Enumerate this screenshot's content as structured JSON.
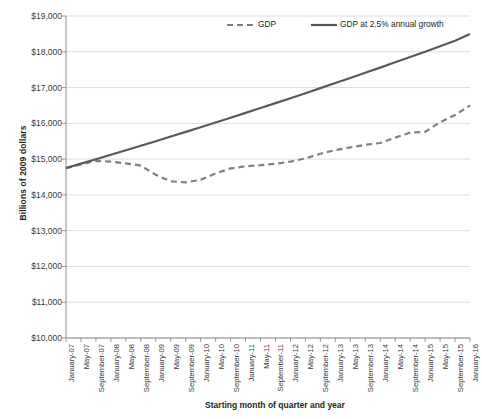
{
  "chart_data": {
    "type": "line",
    "title": "",
    "xlabel": "Starting month of quarter and year",
    "ylabel": "Billions of 2009 dollars",
    "ylim": [
      10000,
      19000
    ],
    "ytick_step": 1000,
    "ytick_labels": [
      "$19,000",
      "$18,000",
      "$17,000",
      "$16,000",
      "$15,000",
      "$14,000",
      "$13,000",
      "$12,000",
      "$11,000",
      "$10,000"
    ],
    "ytick_values": [
      19000,
      18000,
      17000,
      16000,
      15000,
      14000,
      13000,
      12000,
      11000,
      10000
    ],
    "grid": true,
    "legend_position": "top-center",
    "categories": [
      "January-07",
      "May-07",
      "September-07",
      "January-08",
      "May-08",
      "September-08",
      "January-09",
      "May-09",
      "September-09",
      "January-10",
      "May-10",
      "September-10",
      "January-11",
      "May-11",
      "September-11",
      "January-12",
      "May-12",
      "September-12",
      "January-13",
      "May-13",
      "September-13",
      "January-14",
      "May-14",
      "September-14",
      "January-15",
      "May-15",
      "September-15",
      "January-16"
    ],
    "series": [
      {
        "name": "GDP",
        "style": "dashed",
        "color": "#808080",
        "values": [
          14750,
          14850,
          14950,
          14930,
          14880,
          14820,
          14560,
          14380,
          14350,
          14420,
          14600,
          14740,
          14800,
          14830,
          14870,
          14930,
          15020,
          15150,
          15250,
          15330,
          15400,
          15450,
          15600,
          15740,
          15760,
          16030,
          16230,
          16500
        ]
      },
      {
        "name": "GDP at 2.5% annual growth",
        "style": "solid",
        "color": "#595959",
        "values": [
          14750,
          14873,
          14996,
          15121,
          15246,
          15373,
          15501,
          15630,
          15760,
          15891,
          16023,
          16157,
          16292,
          16428,
          16565,
          16703,
          16842,
          16983,
          17125,
          17268,
          17412,
          17558,
          17705,
          17853,
          18003,
          18154,
          18306,
          18500
        ]
      }
    ],
    "legend": [
      {
        "label": "GDP",
        "style": "dashed",
        "color": "#808080"
      },
      {
        "label": "GDP at 2.5% annual growth",
        "style": "solid",
        "color": "#595959"
      }
    ]
  },
  "axis": {
    "plot_left": 66,
    "plot_right": 470,
    "plot_top": 16,
    "plot_bottom": 338
  }
}
